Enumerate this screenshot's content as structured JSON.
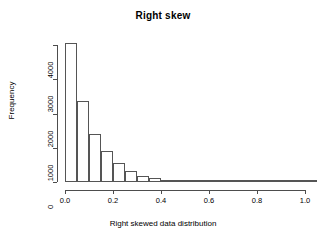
{
  "chart_data": {
    "type": "bar",
    "title": "Right skew",
    "xlabel": "Right skewed data distribution",
    "ylabel": "Frequency",
    "grid": false,
    "legend": null,
    "xlim": [
      0.0,
      1.05
    ],
    "ylim": [
      0,
      4200
    ],
    "xticks": [
      0.0,
      0.2,
      0.4,
      0.6,
      0.8,
      1.0
    ],
    "xtick_labels": [
      "0.0",
      "0.2",
      "0.4",
      "0.6",
      "0.8",
      "1.0"
    ],
    "yticks": [
      0,
      1000,
      2000,
      3000,
      4000
    ],
    "ytick_labels": [
      "0",
      "1000",
      "2000",
      "3000",
      "4000"
    ],
    "bin_width": 0.05,
    "bin_edges": [
      0.0,
      0.05,
      0.1,
      0.15,
      0.2,
      0.25,
      0.3,
      0.35,
      0.4,
      0.45,
      0.5,
      0.55,
      0.6,
      0.65,
      0.7,
      0.75,
      0.8,
      0.85,
      0.9,
      0.95,
      1.0,
      1.05
    ],
    "categories": [
      "0.00-0.05",
      "0.05-0.10",
      "0.10-0.15",
      "0.15-0.20",
      "0.20-0.25",
      "0.25-0.30",
      "0.30-0.35",
      "0.35-0.40",
      "0.40-0.45",
      "0.45-0.50",
      "0.50-0.55",
      "0.55-0.60",
      "0.60-0.65",
      "0.65-0.70",
      "0.70-0.75",
      "0.75-0.80",
      "0.80-0.85",
      "0.85-0.90",
      "0.90-0.95",
      "0.95-1.00",
      "1.00-1.05"
    ],
    "values": [
      4050,
      2360,
      1400,
      900,
      550,
      310,
      190,
      110,
      60,
      35,
      20,
      12,
      7,
      4,
      3,
      2,
      1,
      1,
      1,
      0,
      0
    ]
  }
}
